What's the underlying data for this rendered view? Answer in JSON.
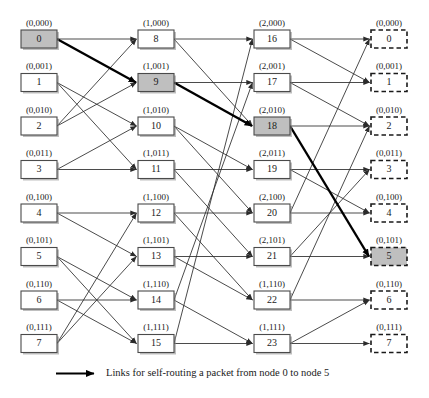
{
  "legend": {
    "arrow_icon": "arrow-right-icon",
    "text": "Links for self-routing a packet from node 0 to node 5"
  },
  "geometry": {
    "columns_x": [
      21,
      138,
      254,
      371
    ],
    "box_width": 36,
    "box_height": 18,
    "row_top_first": 30,
    "row_spacing": 43.5,
    "canvas": [
      429,
      398
    ]
  },
  "colors": {
    "highlight_fill": "#bfbfbf",
    "box_fill": "#ffffff",
    "box_stroke": "#4a4a4a",
    "dashed_stroke": "#1a1a1a",
    "link": "#2b2b2b",
    "link_bold": "#000000",
    "text": "#1a1a1a"
  },
  "columns": [
    {
      "name": "stage-0-input",
      "style": "solid",
      "nodes": [
        {
          "label": "(0,000)",
          "num": "0",
          "highlight": true
        },
        {
          "label": "(0,001)",
          "num": "1",
          "highlight": false
        },
        {
          "label": "(0,010)",
          "num": "2",
          "highlight": false
        },
        {
          "label": "(0,011)",
          "num": "3",
          "highlight": false
        },
        {
          "label": "(0,100)",
          "num": "4",
          "highlight": false
        },
        {
          "label": "(0,101)",
          "num": "5",
          "highlight": false
        },
        {
          "label": "(0,110)",
          "num": "6",
          "highlight": false
        },
        {
          "label": "(0,111)",
          "num": "7",
          "highlight": false
        }
      ]
    },
    {
      "name": "stage-1",
      "style": "solid",
      "nodes": [
        {
          "label": "(1,000)",
          "num": "8",
          "highlight": false
        },
        {
          "label": "(1,001)",
          "num": "9",
          "highlight": true
        },
        {
          "label": "(1,010)",
          "num": "10",
          "highlight": false
        },
        {
          "label": "(1,011)",
          "num": "11",
          "highlight": false
        },
        {
          "label": "(1,100)",
          "num": "12",
          "highlight": false
        },
        {
          "label": "(1,101)",
          "num": "13",
          "highlight": false
        },
        {
          "label": "(1,110)",
          "num": "14",
          "highlight": false
        },
        {
          "label": "(1,111)",
          "num": "15",
          "highlight": false
        }
      ]
    },
    {
      "name": "stage-2",
      "style": "solid",
      "nodes": [
        {
          "label": "(2,000)",
          "num": "16",
          "highlight": false
        },
        {
          "label": "(2,001)",
          "num": "17",
          "highlight": false
        },
        {
          "label": "(2,010)",
          "num": "18",
          "highlight": true
        },
        {
          "label": "(2,011)",
          "num": "19",
          "highlight": false
        },
        {
          "label": "(2,100)",
          "num": "20",
          "highlight": false
        },
        {
          "label": "(2,101)",
          "num": "21",
          "highlight": false
        },
        {
          "label": "(1,110)",
          "num": "22",
          "highlight": false
        },
        {
          "label": "(1,111)",
          "num": "23",
          "highlight": false
        }
      ]
    },
    {
      "name": "stage-3-output",
      "style": "dashed",
      "nodes": [
        {
          "label": "(0,000)",
          "num": "0",
          "highlight": false
        },
        {
          "label": "(0,001)",
          "num": "1",
          "highlight": false
        },
        {
          "label": "(0,010)",
          "num": "2",
          "highlight": false
        },
        {
          "label": "(0,011)",
          "num": "3",
          "highlight": false
        },
        {
          "label": "(0,100)",
          "num": "4",
          "highlight": false
        },
        {
          "label": "(0,101)",
          "num": "5",
          "highlight": true
        },
        {
          "label": "(0,110)",
          "num": "6",
          "highlight": false
        },
        {
          "label": "(0,111)",
          "num": "7",
          "highlight": false
        }
      ]
    }
  ],
  "links": {
    "stage_0_to_1": [
      [
        0,
        0
      ],
      [
        0,
        1
      ],
      [
        1,
        2
      ],
      [
        1,
        3
      ],
      [
        2,
        0
      ],
      [
        2,
        1
      ],
      [
        3,
        2
      ],
      [
        3,
        3
      ],
      [
        4,
        4
      ],
      [
        4,
        5
      ],
      [
        5,
        6
      ],
      [
        5,
        7
      ],
      [
        6,
        6
      ],
      [
        6,
        7
      ],
      [
        7,
        4
      ],
      [
        7,
        5
      ]
    ],
    "stage_1_to_2": [
      [
        0,
        0
      ],
      [
        0,
        2
      ],
      [
        1,
        1
      ],
      [
        1,
        2
      ],
      [
        2,
        3
      ],
      [
        2,
        4
      ],
      [
        3,
        3
      ],
      [
        3,
        5
      ],
      [
        4,
        4
      ],
      [
        4,
        6
      ],
      [
        5,
        5
      ],
      [
        5,
        6
      ],
      [
        6,
        1
      ],
      [
        6,
        7
      ],
      [
        7,
        0
      ],
      [
        7,
        7
      ]
    ],
    "stage_2_to_3": [
      [
        0,
        0
      ],
      [
        0,
        1
      ],
      [
        1,
        1
      ],
      [
        1,
        2
      ],
      [
        2,
        2
      ],
      [
        2,
        5
      ],
      [
        3,
        3
      ],
      [
        3,
        4
      ],
      [
        4,
        0
      ],
      [
        4,
        4
      ],
      [
        5,
        3
      ],
      [
        5,
        5
      ],
      [
        6,
        2
      ],
      [
        6,
        6
      ],
      [
        7,
        6
      ],
      [
        7,
        7
      ]
    ],
    "bold_path": [
      {
        "stage": 0,
        "from": 0,
        "to": 1
      },
      {
        "stage": 1,
        "from": 1,
        "to": 2
      },
      {
        "stage": 2,
        "from": 2,
        "to": 5
      }
    ]
  }
}
